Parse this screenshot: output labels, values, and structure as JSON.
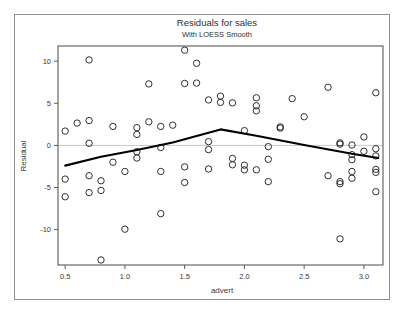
{
  "chart_data": {
    "type": "scatter",
    "title": "Residuals for sales",
    "subtitle": "With LOESS Smooth",
    "xlabel": "advert",
    "ylabel": "Residual",
    "xlim": [
      0.44,
      3.16
    ],
    "ylim": [
      -14.2,
      11.8
    ],
    "xticks": [
      0.5,
      1.0,
      1.5,
      2.0,
      2.5,
      3.0
    ],
    "xtick_labels": [
      "0.5",
      "1.0",
      "1.5",
      "2.0",
      "2.5",
      "3.0"
    ],
    "yticks": [
      10,
      5,
      0,
      -5,
      -10
    ],
    "ytick_labels": [
      "10",
      "5",
      "0",
      "-5",
      "-10"
    ],
    "grid": false,
    "zero_reference_line": 0,
    "legend": null,
    "marker": {
      "shape": "open-circle",
      "size": 3.2,
      "color": "#1a1a1a"
    },
    "series": [
      {
        "name": "Residual",
        "points": [
          [
            0.5,
            1.7
          ],
          [
            0.5,
            -4.0
          ],
          [
            0.5,
            -6.1
          ],
          [
            0.6,
            2.65
          ],
          [
            0.7,
            10.15
          ],
          [
            0.7,
            2.95
          ],
          [
            0.7,
            0.25
          ],
          [
            0.7,
            -3.6
          ],
          [
            0.7,
            -5.6
          ],
          [
            0.8,
            -4.2
          ],
          [
            0.8,
            -5.35
          ],
          [
            0.8,
            -13.6
          ],
          [
            0.9,
            2.25
          ],
          [
            0.9,
            -2.0
          ],
          [
            1.0,
            -3.1
          ],
          [
            1.0,
            -9.95
          ],
          [
            1.1,
            2.1
          ],
          [
            1.1,
            1.3
          ],
          [
            1.1,
            -0.75
          ],
          [
            1.1,
            -1.5
          ],
          [
            1.2,
            7.3
          ],
          [
            1.2,
            2.8
          ],
          [
            1.3,
            2.25
          ],
          [
            1.3,
            -0.25
          ],
          [
            1.3,
            -3.1
          ],
          [
            1.3,
            -8.1
          ],
          [
            1.4,
            2.4
          ],
          [
            1.5,
            11.3
          ],
          [
            1.5,
            7.35
          ],
          [
            1.5,
            -2.55
          ],
          [
            1.5,
            -4.4
          ],
          [
            1.6,
            9.75
          ],
          [
            1.6,
            7.4
          ],
          [
            1.7,
            5.4
          ],
          [
            1.7,
            0.45
          ],
          [
            1.7,
            -0.5
          ],
          [
            1.7,
            -2.8
          ],
          [
            1.8,
            5.85
          ],
          [
            1.8,
            5.1
          ],
          [
            1.9,
            5.05
          ],
          [
            1.9,
            -1.55
          ],
          [
            1.9,
            -2.3
          ],
          [
            2.0,
            1.75
          ],
          [
            2.0,
            -2.35
          ],
          [
            2.0,
            -2.9
          ],
          [
            2.1,
            5.65
          ],
          [
            2.1,
            4.7
          ],
          [
            2.1,
            4.1
          ],
          [
            2.1,
            -2.9
          ],
          [
            2.2,
            -0.15
          ],
          [
            2.2,
            -1.65
          ],
          [
            2.2,
            -4.3
          ],
          [
            2.3,
            2.2
          ],
          [
            2.3,
            2.05
          ],
          [
            2.4,
            5.55
          ],
          [
            2.5,
            3.4
          ],
          [
            2.7,
            6.9
          ],
          [
            2.7,
            -3.6
          ],
          [
            2.8,
            0.3
          ],
          [
            2.8,
            0.15
          ],
          [
            2.8,
            -4.3
          ],
          [
            2.8,
            -4.55
          ],
          [
            2.8,
            -11.1
          ],
          [
            2.9,
            0.05
          ],
          [
            2.9,
            -1.1
          ],
          [
            2.9,
            -1.7
          ],
          [
            2.9,
            -3.1
          ],
          [
            2.9,
            -3.9
          ],
          [
            3.0,
            1.0
          ],
          [
            3.0,
            -0.7
          ],
          [
            3.1,
            6.25
          ],
          [
            3.1,
            -0.4
          ],
          [
            3.1,
            -1.25
          ],
          [
            3.1,
            -2.85
          ],
          [
            3.1,
            -3.2
          ],
          [
            3.1,
            -5.5
          ]
        ]
      }
    ],
    "loess_smooth": {
      "name": "LOESS Smooth",
      "color": "#000000",
      "width": 2.1,
      "points": [
        [
          0.5,
          -2.4
        ],
        [
          0.8,
          -1.35
        ],
        [
          1.1,
          -0.55
        ],
        [
          1.4,
          0.35
        ],
        [
          1.8,
          1.9
        ],
        [
          2.1,
          1.15
        ],
        [
          2.5,
          0.05
        ],
        [
          2.9,
          -1.0
        ],
        [
          3.12,
          -1.5
        ]
      ]
    }
  },
  "figure": {
    "title": "Residuals for sales",
    "subtitle": "With LOESS Smooth",
    "x_axis_label": "advert",
    "y_axis_label": "Residual"
  },
  "colors": {
    "frame": "#8f8f8f",
    "axis": "#5a5a5a",
    "marker": "#1a1a1a",
    "smooth_line": "#000000",
    "zero_line": "#c8c8c8",
    "background": "#ffffff",
    "text": "#3a3a3a"
  }
}
